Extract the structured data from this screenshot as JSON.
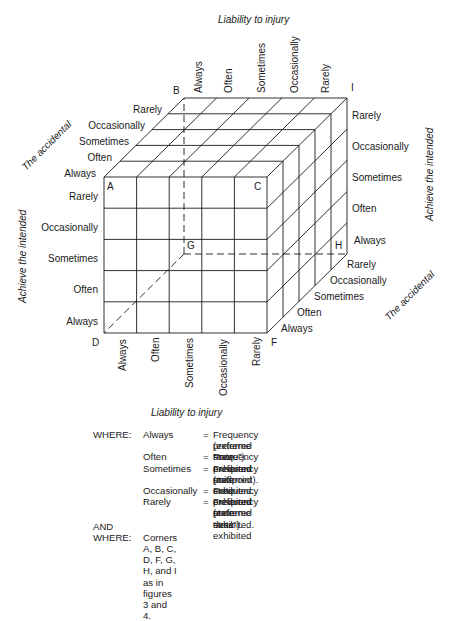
{
  "diagram": {
    "title_top": "Liability to injury",
    "title_bottom": "Liability to injury",
    "axis_left_vertical": "Achieve the intended",
    "axis_right_vertical": "Achieve the intended",
    "axis_left_diagonal": "The accidental",
    "axis_right_diagonal": "The accidental",
    "top_labels": [
      "Always",
      "Often",
      "Sometimes",
      "Occasionally",
      "Rarely"
    ],
    "bottom_labels": [
      "Always",
      "Often",
      "Sometimes",
      "Occasionally",
      "Rarely"
    ],
    "left_vertical_labels": [
      "Rarely",
      "Occasionally",
      "Sometimes",
      "Often",
      "Always"
    ],
    "right_vertical_labels": [
      "Rarely",
      "Occasionally",
      "Sometimes",
      "Often",
      "Always"
    ],
    "left_diagonal_labels": [
      "Rarely",
      "Occasionally",
      "Sometimes",
      "Often",
      "Always"
    ],
    "right_diagonal_labels": [
      "Rarely",
      "Occasionally",
      "Sometimes",
      "Often",
      "Always"
    ],
    "corners": {
      "A": "A",
      "B": "B",
      "C": "C",
      "D": "D",
      "F": "F",
      "G": "G",
      "H": "H",
      "I": "I"
    },
    "grid_divisions": 5,
    "line_color": "#1a1a1a"
  },
  "legend": {
    "where_label": "WHERE:",
    "rows": [
      {
        "term": "Always",
        "eq": "=",
        "def": "Frequency preferred state exhibited"
      },
      {
        "term": "",
        "eq": "",
        "def": "(extreme “more”)."
      },
      {
        "term": "Often",
        "eq": "=",
        "def": "Frequency preferred state exhibited."
      },
      {
        "term": "Sometimes",
        "eq": "=",
        "def": "Frequency preferred state exhibited"
      },
      {
        "term": "",
        "eq": "",
        "def": "(midpoint)."
      },
      {
        "term": "Occasionally",
        "eq": "=",
        "def": "Frequency preferred state exhibited."
      },
      {
        "term": "Rarely",
        "eq": "=",
        "def": "Frequency preferred state exhibited"
      },
      {
        "term": "",
        "eq": "",
        "def": "(extreme “less”)."
      }
    ],
    "and_label": "AND",
    "where2_label": "WHERE:",
    "corners_note": "Corners A, B, C, D, F, G, H, and I as in figures 3 and 4."
  }
}
